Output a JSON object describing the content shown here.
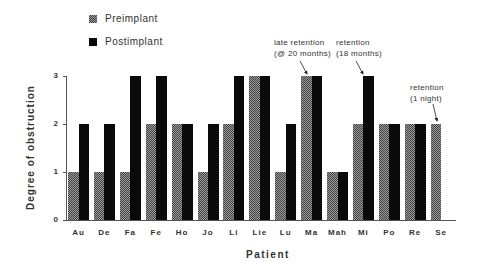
{
  "chart_data": {
    "type": "bar",
    "title": "",
    "xlabel": "Patient",
    "ylabel": "Degree of obstruction",
    "ylim": [
      0,
      3
    ],
    "yticks": [
      0,
      1,
      2,
      3
    ],
    "grid": false,
    "legend_position": "top-left",
    "categories": [
      "Au",
      "De",
      "Fa",
      "Fe",
      "Ho",
      "Jo",
      "Li",
      "Lie",
      "Lu",
      "Ma",
      "Mah",
      "Mi",
      "Po",
      "Re",
      "Se"
    ],
    "series": [
      {
        "name": "Preimplant",
        "pattern": "hatched-gray",
        "values": [
          1,
          1,
          1,
          2,
          2,
          1,
          2,
          3,
          1,
          3,
          1,
          2,
          2,
          2,
          2
        ]
      },
      {
        "name": "Postimplant",
        "pattern": "solid-black",
        "values": [
          2,
          2,
          3,
          3,
          2,
          2,
          3,
          3,
          2,
          3,
          1,
          3,
          2,
          2,
          null
        ]
      }
    ],
    "annotations": [
      {
        "text": "late retention\n(@ 20 months)",
        "target": "Ma"
      },
      {
        "text": "retention\n(18 months)",
        "target": "Mi"
      },
      {
        "text": "retention\n(1 night)",
        "target": "Se"
      }
    ]
  },
  "legend": {
    "items": [
      {
        "label": "Preimplant"
      },
      {
        "label": "Postimplant"
      }
    ]
  },
  "colors": {
    "preimplant": "#9a9a9a",
    "postimplant": "#0a0a0a",
    "axis": "#555555"
  }
}
